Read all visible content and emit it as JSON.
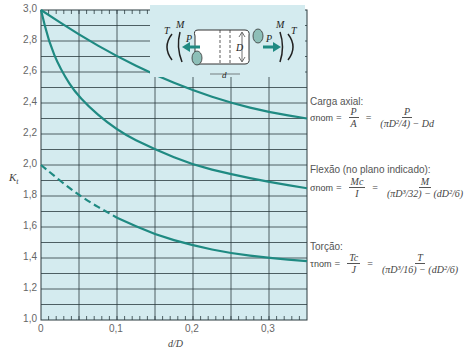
{
  "chart_data": {
    "type": "line",
    "title": "",
    "xlabel": "d/D",
    "ylabel": "K_t",
    "xlim": [
      0,
      0.35
    ],
    "ylim": [
      1.0,
      3.0
    ],
    "grid": true,
    "x_ticks": [
      "0",
      "0,1",
      "0,2",
      "0,3"
    ],
    "y_ticks": [
      "1,0",
      "1,2",
      "1,4",
      "1,6",
      "1,8",
      "2,0",
      "2,2",
      "2,4",
      "2,6",
      "2,8",
      "3,0"
    ],
    "series": [
      {
        "name": "Carga axial",
        "x": [
          0,
          0.05,
          0.1,
          0.15,
          0.2,
          0.25,
          0.3,
          0.35
        ],
        "y": [
          3.0,
          2.84,
          2.7,
          2.58,
          2.48,
          2.4,
          2.34,
          2.3
        ]
      },
      {
        "name": "Flexão (no plano indicado)",
        "x": [
          0,
          0.01,
          0.025,
          0.05,
          0.1,
          0.15,
          0.2,
          0.25,
          0.3,
          0.35
        ],
        "y": [
          3.0,
          2.8,
          2.62,
          2.43,
          2.22,
          2.1,
          2.0,
          1.94,
          1.89,
          1.85
        ]
      },
      {
        "name": "Torção",
        "x": [
          0,
          0.05,
          0.1,
          0.15,
          0.2,
          0.25,
          0.3,
          0.35
        ],
        "y": [
          2.0,
          1.8,
          1.66,
          1.55,
          1.48,
          1.43,
          1.4,
          1.38
        ],
        "dashed_until": 0.1
      }
    ],
    "legend_position": "right, inline annotations"
  },
  "axis": {
    "y_label": "K",
    "y_label_sub": "t",
    "x_label": "d/D",
    "y_ticks": [
      "3,0",
      "2,8",
      "2,6",
      "2,4",
      "2,2",
      "2,0",
      "1,8",
      "1,6",
      "1,4",
      "1,2",
      "1,0"
    ],
    "x_ticks": [
      "0",
      "0,1",
      "0,2",
      "0,3"
    ]
  },
  "diagram": {
    "labels": {
      "T": "T",
      "M": "M",
      "P": "P",
      "D": "D",
      "d": "d"
    }
  },
  "annotations": {
    "axial": {
      "title": "Carga axial:",
      "sigma": "σ",
      "sub": "nom",
      "num1": "P",
      "den1": "A",
      "num2": "P",
      "den2": "(πD²/4) − Dd"
    },
    "bending": {
      "title": "Flexão (no plano indicado):",
      "sigma": "σ",
      "sub": "nom",
      "num1": "Mc",
      "den1": "I",
      "num2": "M",
      "den2": "(πD³/32) − (dD²/6)"
    },
    "torsion": {
      "title": "Torção:",
      "sigma": "τ",
      "sub": "nom",
      "num1": "Tc",
      "den1": "J",
      "num2": "T",
      "den2": "(πD³/16) − (dD²/6)"
    }
  },
  "colors": {
    "plot_bg": "#d4ebef",
    "grid": "#2b3b3f",
    "curve": "#1f8a82",
    "diagram_fill": "#8dbfb8"
  }
}
